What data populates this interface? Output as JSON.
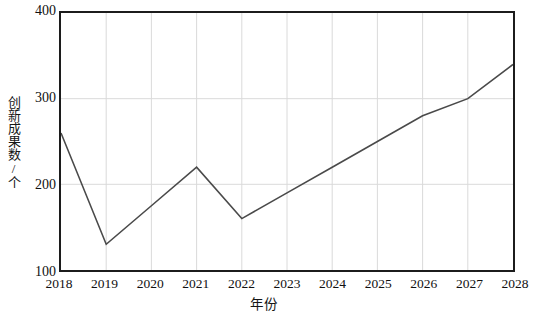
{
  "chart_data": {
    "type": "line",
    "title": "",
    "xlabel": "年份",
    "ylabel": "创新成果数/个",
    "x": [
      2018,
      2019,
      2020,
      2021,
      2022,
      2023,
      2024,
      2025,
      2026,
      2027,
      2028
    ],
    "categories": [
      "2018",
      "2019",
      "2020",
      "2021",
      "2022",
      "2023",
      "2024",
      "2025",
      "2026",
      "2027",
      "2028"
    ],
    "values": [
      260,
      130,
      175,
      220,
      160,
      190,
      220,
      250,
      280,
      300,
      340
    ],
    "series": [
      {
        "name": "创新成果数",
        "values": [
          260,
          130,
          175,
          220,
          160,
          190,
          220,
          250,
          280,
          300,
          340
        ]
      }
    ],
    "xlim": [
      2018,
      2028
    ],
    "ylim": [
      100,
      400
    ],
    "yticks": [
      100,
      200,
      300,
      400
    ],
    "ytick_labels": [
      "100",
      "200",
      "300",
      "400"
    ],
    "xtick_labels": [
      "2018",
      "2019",
      "2020",
      "2021",
      "2022",
      "2023",
      "2024",
      "2025",
      "2026",
      "2027",
      "2028"
    ],
    "grid": true,
    "grid_color": "#d9d9d9",
    "line_color": "#4a4a4a",
    "axis_color": "#1c1c1c",
    "background_color": "#ffffff",
    "legend": false,
    "legend_position": "none",
    "markers": false,
    "annotations": []
  }
}
